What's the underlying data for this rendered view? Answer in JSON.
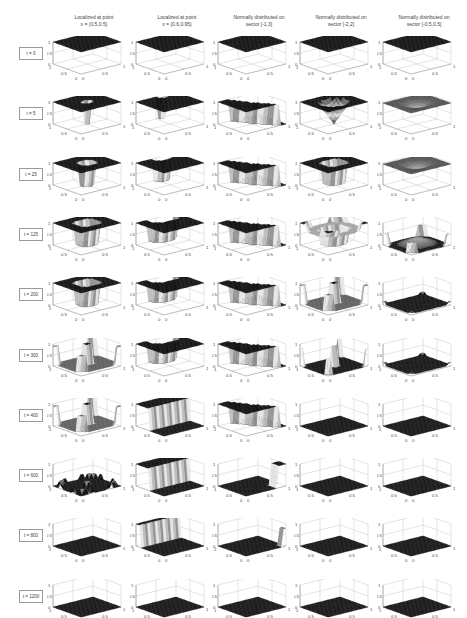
{
  "figure": {
    "columns": [
      {
        "title_line1": "Localized at point",
        "title_line2": "x = (0.5,0.5)"
      },
      {
        "title_line1": "Localized at point",
        "title_line2": "x = (0.6,0.95)"
      },
      {
        "title_line1": "Normally distributed on",
        "title_line2": "sector [-1,3]"
      },
      {
        "title_line1": "Normally distributed on",
        "title_line2": "sector [-2,2]"
      },
      {
        "title_line1": "Normally distributed on",
        "title_line2": "sector [-0.5,0.5]"
      }
    ],
    "rows": [
      {
        "label": "t = 0"
      },
      {
        "label": "t = 5"
      },
      {
        "label": "t = 25"
      },
      {
        "label": "t = 125"
      },
      {
        "label": "t = 200"
      },
      {
        "label": "t = 300"
      },
      {
        "label": "t = 400"
      },
      {
        "label": "t = 600"
      },
      {
        "label": "t = 800"
      },
      {
        "label": "t = 1200"
      }
    ],
    "axis_ticks": {
      "z": [
        "0",
        "0.5",
        "1"
      ],
      "x": [
        "0",
        "0.5",
        "1"
      ],
      "y": [
        "0",
        "0.5",
        "1"
      ]
    }
  },
  "chart_data": {
    "type": "surface-grid",
    "title": "",
    "layout": {
      "rows": 10,
      "cols": 5,
      "subplot_type": "3d surface"
    },
    "row_labels": [
      "t = 0",
      "t = 5",
      "t = 25",
      "t = 125",
      "t = 200",
      "t = 300",
      "t = 400",
      "t = 600",
      "t = 800",
      "t = 1200"
    ],
    "col_labels": [
      "Localized at point x = (0.5,0.5)",
      "Localized at point x = (0.6,0.95)",
      "Normally distributed on sector [-1,3]",
      "Normally distributed on sector [-2,2]",
      "Normally distributed on sector [-0.5,0.5]"
    ],
    "axes": {
      "xlim": [
        0,
        1
      ],
      "ylim": [
        0,
        1
      ],
      "zlim": [
        0,
        1
      ],
      "xticks": [
        0,
        0.5,
        1
      ],
      "yticks": [
        0,
        0.5,
        1
      ],
      "zticks": [
        0,
        0.5,
        1
      ],
      "grid": true
    },
    "surface_shapes": [
      [
        "flat-1",
        "flat-1",
        "flat-1",
        "flat-1",
        "flat-1"
      ],
      [
        "flat-1-narrow-hole-center",
        "flat-1-narrow-hole-edge",
        "sector-step",
        "funnel-center",
        "flat-1-dip-center"
      ],
      [
        "flat-1-hole-center",
        "flat-1-hole-edge",
        "sector-step",
        "well-center",
        "flat-1-dip-center"
      ],
      [
        "flat-1-wide-hole-center",
        "flat-1-wide-hole-edge",
        "sector-step",
        "well-with-corner-peaks",
        "low-with-corner-peaks"
      ],
      [
        "flat-1-wide-hole-center",
        "flat-1-wide-hole-edge",
        "sector-step",
        "center-peak-corner-peaks",
        "near-zero"
      ],
      [
        "center-peak-corner-peaks",
        "flat-1-wide-hole-edge",
        "sector-step",
        "peaks-low",
        "near-zero"
      ],
      [
        "center-peak-corner-peaks",
        "step-ridge",
        "sector-step",
        "flat-0",
        "flat-0"
      ],
      [
        "flat-0-small-bumps",
        "step-ridge",
        "sector-step-corner",
        "flat-0",
        "flat-0"
      ],
      [
        "flat-0",
        "step-edge",
        "sector-step-corner-small",
        "flat-0",
        "flat-0"
      ],
      [
        "flat-0",
        "flat-0",
        "flat-0",
        "flat-0",
        "flat-0"
      ]
    ]
  }
}
